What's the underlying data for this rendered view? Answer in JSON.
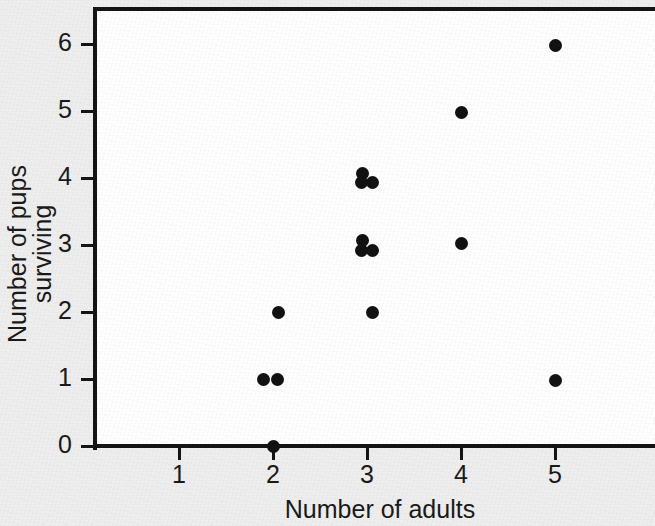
{
  "chart_data": {
    "type": "scatter",
    "title": "",
    "xlabel": "Number of adults",
    "ylabel": "Number of pups surviving",
    "xlim": [
      0.5,
      5.7
    ],
    "ylim": [
      0,
      6.5
    ],
    "grid": false,
    "legend": null,
    "xticks": [
      "1",
      "2",
      "3",
      "4",
      "5"
    ],
    "xtick_values": [
      1,
      2,
      3,
      4,
      5
    ],
    "yticks": [
      "0",
      "1",
      "2",
      "3",
      "4",
      "5",
      "6"
    ],
    "ytick_values": [
      0,
      1,
      2,
      3,
      4,
      5,
      6
    ],
    "marker": "filled-circle",
    "marker_color": "#111111",
    "note": "Points are jittered slightly so overlapping observations remain visible.",
    "points": [
      {
        "x": 2,
        "y": 0,
        "jx": 0.0,
        "jy": 0.0
      },
      {
        "x": 2,
        "y": 1,
        "jx": -0.1,
        "jy": 0.0
      },
      {
        "x": 2,
        "y": 1,
        "jx": 0.05,
        "jy": 0.0
      },
      {
        "x": 2,
        "y": 2,
        "jx": 0.06,
        "jy": 0.0
      },
      {
        "x": 3,
        "y": 2,
        "jx": 0.06,
        "jy": 0.0
      },
      {
        "x": 3,
        "y": 3,
        "jx": -0.05,
        "jy": 0.07
      },
      {
        "x": 3,
        "y": 3,
        "jx": -0.06,
        "jy": -0.08
      },
      {
        "x": 3,
        "y": 3,
        "jx": 0.06,
        "jy": -0.08
      },
      {
        "x": 3,
        "y": 4,
        "jx": -0.05,
        "jy": 0.07
      },
      {
        "x": 3,
        "y": 4,
        "jx": -0.06,
        "jy": -0.07
      },
      {
        "x": 3,
        "y": 4,
        "jx": 0.06,
        "jy": -0.07
      },
      {
        "x": 4,
        "y": 3,
        "jx": 0.0,
        "jy": 0.02
      },
      {
        "x": 4,
        "y": 5,
        "jx": 0.0,
        "jy": -0.02
      },
      {
        "x": 5,
        "y": 1,
        "jx": 0.0,
        "jy": -0.02
      },
      {
        "x": 5,
        "y": 6,
        "jx": 0.0,
        "jy": -0.02
      }
    ],
    "summary_counts": {
      "2": [
        0,
        1,
        1,
        2
      ],
      "3": [
        2,
        3,
        3,
        3,
        4,
        4,
        4
      ],
      "4": [
        3,
        5
      ],
      "5": [
        1,
        6
      ]
    },
    "colors": {
      "axis": "#141414",
      "marker": "#111111",
      "plot_background": "#ffffff",
      "figure_background": "#efeeee",
      "text": "#1a1a1a"
    }
  },
  "axes_geometry": {
    "x_tick_px": [
      179,
      273,
      367,
      461,
      555
    ],
    "y_tick_px": [
      446,
      379,
      312,
      245,
      178,
      111,
      44
    ]
  }
}
